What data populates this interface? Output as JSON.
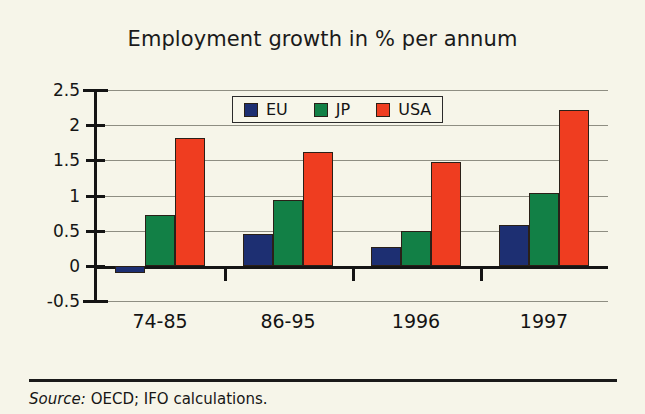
{
  "chart_data": {
    "type": "bar",
    "title": "Employment growth in % per annum",
    "xlabel": "",
    "ylabel": "",
    "categories": [
      "74-85",
      "86-95",
      "1996",
      "1997"
    ],
    "series": [
      {
        "name": "EU",
        "color": "#1d2f72",
        "values": [
          -0.1,
          0.45,
          0.27,
          0.58
        ]
      },
      {
        "name": "JP",
        "color": "#128046",
        "values": [
          0.73,
          0.94,
          0.5,
          1.04
        ]
      },
      {
        "name": "USA",
        "color": "#ef3d20",
        "values": [
          1.82,
          1.62,
          1.48,
          2.22
        ]
      }
    ],
    "ylim": [
      -0.5,
      2.5
    ],
    "ytick_labels": [
      "2.5",
      "2",
      "1.5",
      "1",
      "0.5",
      "0",
      "-0.5"
    ],
    "ytick_values": [
      2.5,
      2,
      1.5,
      1,
      0.5,
      0,
      -0.5
    ],
    "grid": true,
    "legend_position": "top-center",
    "legend_entries": [
      "EU",
      "JP",
      "USA"
    ]
  },
  "footer": {
    "source_word": "Source:",
    "source_text": " OECD; IFO calculations."
  },
  "colors": {
    "background": "#f6f5e9",
    "axis": "#141414",
    "grid": "#8e8e82",
    "eu": "#1d2f72",
    "jp": "#128046",
    "usa": "#ef3d20"
  }
}
